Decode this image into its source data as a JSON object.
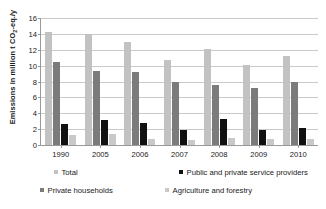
{
  "chart_data": {
    "type": "bar",
    "title": "",
    "xlabel": "",
    "ylabel": "Emissions in million t CO2-eq./y",
    "ylabel_parts": {
      "pre": "Emissions in million t CO",
      "sub": "2",
      "post": "-eq./y"
    },
    "categories": [
      "1990",
      "2005",
      "2006",
      "2007",
      "2008",
      "2009",
      "2010"
    ],
    "ylim": [
      0,
      16
    ],
    "yticks": [
      0,
      2,
      4,
      6,
      8,
      10,
      12,
      14,
      16
    ],
    "grid": "horizontal",
    "legend_position": "bottom",
    "series": [
      {
        "name": "Total",
        "color": "#c2c2c2",
        "values": [
          14.3,
          14.0,
          13.0,
          10.7,
          12.1,
          10.1,
          11.2
        ]
      },
      {
        "name": "Private households",
        "color": "#7b7b7b",
        "values": [
          10.4,
          9.3,
          9.2,
          7.9,
          7.6,
          7.2,
          8.0
        ]
      },
      {
        "name": "Public and private service providers",
        "color": "#111111",
        "values": [
          2.6,
          3.2,
          2.8,
          1.9,
          3.3,
          1.85,
          2.1
        ]
      },
      {
        "name": "Agriculture and forestry",
        "color": "#c9c9c9",
        "values": [
          1.25,
          1.35,
          0.7,
          0.65,
          0.9,
          0.8,
          0.8
        ]
      }
    ],
    "legend_layout": [
      [
        {
          "name": "Total",
          "color": "#c2c2c2"
        },
        {
          "name": "Public and private service providers",
          "color": "#111111"
        }
      ],
      [
        {
          "name": "Private households",
          "color": "#7b7b7b"
        },
        {
          "name": "Agriculture and forestry",
          "color": "#c9c9c9"
        }
      ]
    ]
  }
}
